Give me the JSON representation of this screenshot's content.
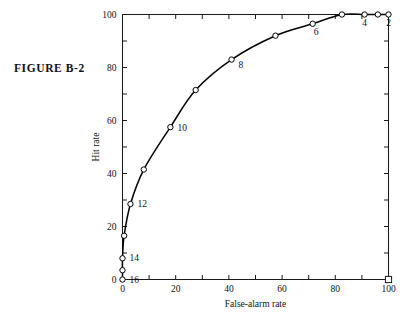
{
  "figure": {
    "label": "FIGURE B-2"
  },
  "chart_data": {
    "type": "line",
    "title": "",
    "subtitle": "",
    "xlabel": "False-alarm rate",
    "ylabel": "Hit rate",
    "xlim": [
      0,
      100
    ],
    "ylim": [
      0,
      100
    ],
    "xticks": [
      0,
      10,
      20,
      30,
      40,
      50,
      60,
      70,
      80,
      90,
      100
    ],
    "yticks": [
      0,
      10,
      20,
      30,
      40,
      50,
      60,
      70,
      80,
      90,
      100
    ],
    "xtick_labels": [
      "0",
      "20",
      "40",
      "60",
      "80",
      "100"
    ],
    "xtick_label_values": [
      0,
      20,
      40,
      60,
      80,
      100
    ],
    "ytick_labels": [
      "0",
      "20",
      "40",
      "60",
      "80",
      "100"
    ],
    "ytick_label_values": [
      0,
      20,
      40,
      60,
      80,
      100
    ],
    "grid": false,
    "legend": "none",
    "marker": "open-circle",
    "series": [
      {
        "name": "ROC curve",
        "points": [
          {
            "x": 0.0,
            "y": 0.0,
            "label": "16",
            "label_dx": 7,
            "label_dy": 3
          },
          {
            "x": 0.0,
            "y": 3.5,
            "label": "",
            "label_dx": 0,
            "label_dy": 0
          },
          {
            "x": 0.0,
            "y": 8.0,
            "label": "14",
            "label_dx": 7,
            "label_dy": 3
          },
          {
            "x": 0.6,
            "y": 16.5,
            "label": "",
            "label_dx": 0,
            "label_dy": 0
          },
          {
            "x": 3.0,
            "y": 28.5,
            "label": "12",
            "label_dx": 7,
            "label_dy": 3
          },
          {
            "x": 8.0,
            "y": 41.5,
            "label": "",
            "label_dx": 0,
            "label_dy": 0
          },
          {
            "x": 18.0,
            "y": 57.5,
            "label": "10",
            "label_dx": 7,
            "label_dy": 4
          },
          {
            "x": 27.5,
            "y": 71.5,
            "label": "",
            "label_dx": 0,
            "label_dy": 0
          },
          {
            "x": 41.0,
            "y": 83.0,
            "label": "8",
            "label_dx": 7,
            "label_dy": 8
          },
          {
            "x": 57.5,
            "y": 92.0,
            "label": "",
            "label_dx": 0,
            "label_dy": 0
          },
          {
            "x": 71.5,
            "y": 96.5,
            "label": "6",
            "label_dx": 1,
            "label_dy": 11
          },
          {
            "x": 82.5,
            "y": 100.0,
            "label": "",
            "label_dx": 0,
            "label_dy": 0
          },
          {
            "x": 91.0,
            "y": 100.0,
            "label": "4",
            "label_dx": 0,
            "label_dy": 11
          },
          {
            "x": 96.0,
            "y": 100.0,
            "label": "",
            "label_dx": 0,
            "label_dy": 0
          },
          {
            "x": 100.0,
            "y": 100.0,
            "label": "2",
            "label_dx": 0,
            "label_dy": 11
          }
        ]
      }
    ],
    "extra_markers": [
      {
        "name": "corner-square",
        "shape": "square",
        "x": 100.0,
        "y": 0.0
      }
    ],
    "annotations": [
      {
        "text": "16",
        "x": 0.0,
        "y": 0.0
      },
      {
        "text": "14",
        "x": 0.0,
        "y": 8.0
      },
      {
        "text": "12",
        "x": 3.0,
        "y": 28.5
      },
      {
        "text": "10",
        "x": 18.0,
        "y": 57.5
      },
      {
        "text": "8",
        "x": 41.0,
        "y": 83.0
      },
      {
        "text": "6",
        "x": 71.5,
        "y": 96.5
      },
      {
        "text": "4",
        "x": 91.0,
        "y": 100.0
      },
      {
        "text": "2",
        "x": 100.0,
        "y": 100.0
      }
    ]
  },
  "colors": {
    "ink": "#000000",
    "axis": "#1a1a1a",
    "background": "#ffffff",
    "marker_fill": "#ffffff"
  }
}
